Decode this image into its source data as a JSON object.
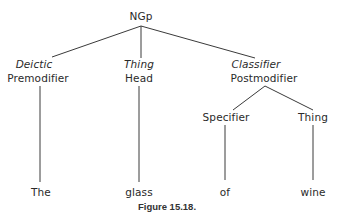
{
  "diagram": {
    "type": "tree",
    "root": {
      "id": "ngp",
      "label": "NGp"
    },
    "nodes": [
      {
        "id": "pre",
        "function": "Deictic",
        "role": "Premodifier",
        "parent": "ngp"
      },
      {
        "id": "head",
        "function": "Thing",
        "role": "Head",
        "parent": "ngp"
      },
      {
        "id": "post",
        "function": "Classifier",
        "role": "Postmodifier",
        "parent": "ngp"
      },
      {
        "id": "spec",
        "label": "Specifier",
        "parent": "post"
      },
      {
        "id": "thing",
        "label": "Thing",
        "parent": "post"
      }
    ],
    "leaves": [
      {
        "word": "The",
        "parent": "pre"
      },
      {
        "word": "glass",
        "parent": "head"
      },
      {
        "word": "of",
        "parent": "spec"
      },
      {
        "word": "wine",
        "parent": "thing"
      }
    ],
    "caption": "Figure 15.18."
  }
}
